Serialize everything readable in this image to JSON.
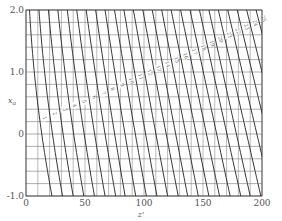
{
  "chart_data": {
    "type": "line",
    "title": "",
    "xlabel": "z'",
    "ylabel": "x_a",
    "xlim": [
      0,
      200
    ],
    "ylim": [
      -1.0,
      2.0
    ],
    "xticks": [
      0,
      50,
      100,
      150,
      200
    ],
    "xtick_labels": [
      "0",
      "50",
      "100",
      "150",
      "200"
    ],
    "yticks": [
      2.0,
      1.0,
      0,
      -1.0
    ],
    "ytick_labels": [
      "2.0",
      "1.0",
      "0",
      "-1.0"
    ],
    "grid": true,
    "grid_x_step": 10,
    "grid_y_step": 0.2,
    "legend": "none (curves labeled inline along diagonal)",
    "curve_labels": [
      "1",
      "2",
      "3",
      "4",
      "5",
      "6",
      "7",
      "8",
      "9",
      "10",
      "11",
      "12",
      "13",
      "14",
      "15",
      "16",
      "17",
      "18",
      "19",
      "20",
      "21",
      "22",
      "23",
      "24",
      "25"
    ],
    "series_description": "Family of 25 curves; each runs from top (x_a=2.0) to bottom (x_a=-1.0), slanting to larger z' as x_a decreases; low-numbered curves are more strongly curved.",
    "series_endpoints": {
      "z_at_top_xa_2": [
        3,
        11,
        19,
        27,
        35,
        43,
        51,
        59,
        67,
        75,
        83,
        91,
        99,
        107,
        115,
        123,
        131,
        139,
        147,
        155,
        163,
        171,
        179,
        187,
        195
      ],
      "z_at_bottom_xa_-1": [
        22,
        31,
        40,
        49,
        58,
        67,
        76,
        84,
        93,
        102,
        111,
        120,
        129,
        137,
        146,
        155,
        164,
        173,
        182,
        190,
        199,
        208,
        217,
        226,
        235
      ]
    }
  },
  "axes": {
    "x_label": "z'",
    "y_label": "x_a"
  }
}
